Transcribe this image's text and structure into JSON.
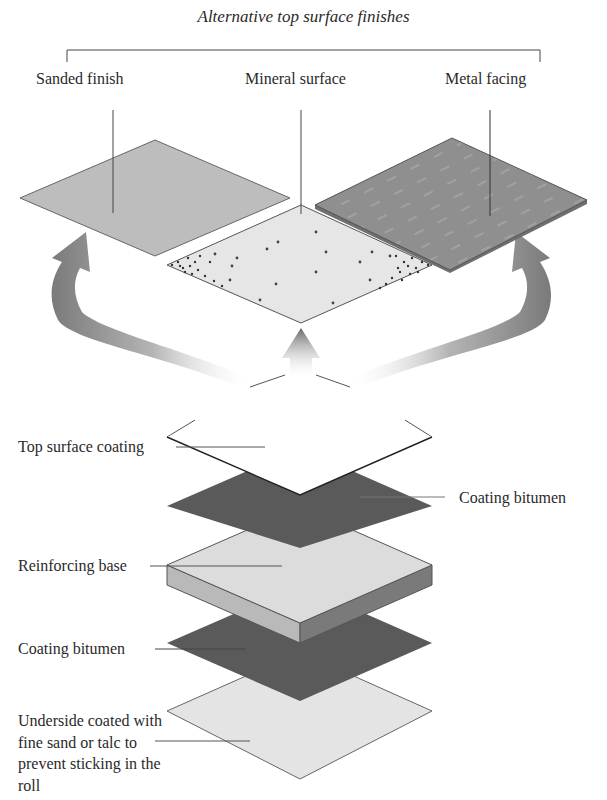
{
  "title": "Alternative top surface finishes",
  "finishes": [
    {
      "label": "Sanded finish",
      "fill": "#bdbdbd"
    },
    {
      "label": "Mineral surface",
      "fill": "#e6e6e6"
    },
    {
      "label": "Metal facing",
      "fill": "#8e8e8e"
    }
  ],
  "layers": [
    {
      "label": "Top surface coating",
      "fill": "#ffffff",
      "side": "left"
    },
    {
      "label": "Coating bitumen",
      "fill": "#5a5a5a",
      "side": "right"
    },
    {
      "label": "Reinforcing base",
      "fill": "#dcdcdc",
      "side": "left"
    },
    {
      "label": "Coating bitumen",
      "fill": "#5a5a5a",
      "side": "left"
    },
    {
      "label": "Underside coated with fine sand or talc to prevent sticking in the roll",
      "fill": "#e4e4e4",
      "side": "left"
    }
  ],
  "colors": {
    "arrow_dark": "#6e6e6e",
    "outline": "#555555"
  }
}
